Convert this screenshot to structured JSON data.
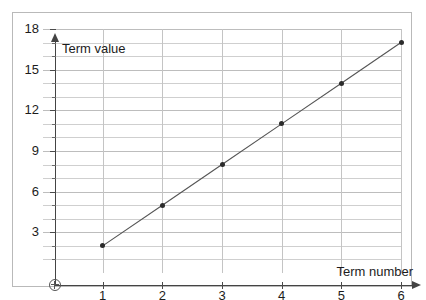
{
  "chart_data": {
    "type": "line",
    "title": "",
    "subtitle": "",
    "xlabel": "Term number",
    "ylabel": "Term value",
    "x": [
      1,
      2,
      3,
      4,
      5,
      6
    ],
    "values": [
      2,
      5,
      8,
      11,
      14,
      17
    ],
    "series": [
      {
        "name": "Term value",
        "x": [
          1,
          2,
          3,
          4,
          5,
          6
        ],
        "values": [
          2,
          5,
          8,
          11,
          14,
          17
        ]
      }
    ],
    "xlim": [
      0,
      6
    ],
    "ylim": [
      0,
      18
    ],
    "x_tick_labels": [
      "1",
      "2",
      "3",
      "4",
      "5",
      "6"
    ],
    "y_tick_labels": [
      "3",
      "6",
      "9",
      "12",
      "15",
      "18"
    ],
    "y_major_ticks": [
      3,
      6,
      9,
      12,
      15,
      18
    ],
    "y_minor_ticks": [
      1,
      2,
      4,
      5,
      7,
      8,
      10,
      11,
      13,
      14,
      16,
      17
    ],
    "grid": true,
    "legend": null,
    "legend_position": "none",
    "markers": "filled-circle",
    "line_color": "#555555",
    "marker_color": "#2b2b2b",
    "grid_color": "#cfcfcf",
    "axis_color": "#444444",
    "origin_symbol": "circled-cross",
    "annotations": []
  },
  "axis_titles": {
    "y": "Term value",
    "x": "Term number"
  }
}
